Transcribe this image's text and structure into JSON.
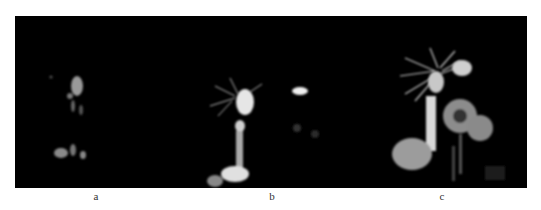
{
  "figure": {
    "panels": [
      {
        "id": "a",
        "label": "a",
        "description": "MRCP image, faint biliary structures"
      },
      {
        "id": "b",
        "label": "b",
        "description": "MRCP image, biliary tree with gallbladder and duct"
      },
      {
        "id": "c",
        "label": "c",
        "description": "MRCP image, dilated intrahepatic ducts and cystic lesions"
      }
    ],
    "colors": {
      "background": "#000000",
      "page": "#ffffff",
      "label": "#333333"
    }
  }
}
